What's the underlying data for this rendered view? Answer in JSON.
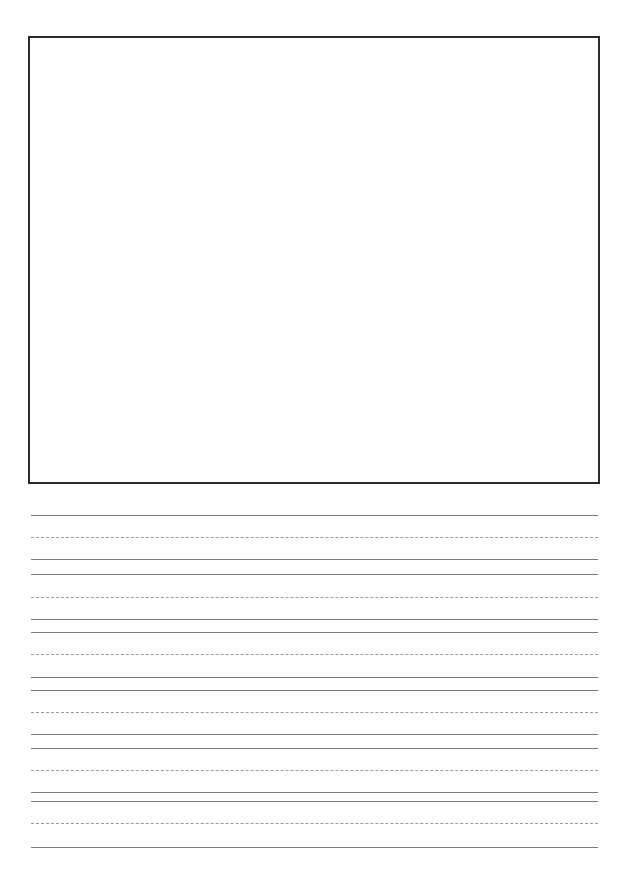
{
  "page": {
    "type": "handwriting-practice-sheet",
    "drawing_box": {
      "label": ""
    },
    "writing_rows": [
      {
        "top": 515,
        "mid": 537,
        "base": 559
      },
      {
        "top": 574,
        "mid": 597,
        "base": 619
      },
      {
        "top": 632,
        "mid": 654,
        "base": 677
      },
      {
        "top": 690,
        "mid": 712,
        "base": 734
      },
      {
        "top": 748,
        "mid": 770,
        "base": 792
      },
      {
        "top": 801,
        "mid": 823,
        "base": 847
      }
    ],
    "colors": {
      "box_border": "#2b2b2b",
      "solid_line": "#7a7a7a",
      "dashed_line": "#9a9a9a"
    }
  }
}
